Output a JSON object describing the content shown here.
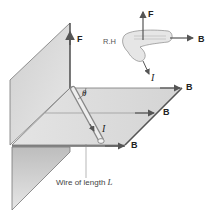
{
  "diagram": {
    "labels": {
      "force_plane": "F",
      "force_hand": "F",
      "field_hand": "B",
      "current_hand": "I",
      "right_hand": "R.H",
      "field_top": "B",
      "field_middle": "B",
      "field_bottom": "B",
      "angle": "θ",
      "current_wire": "I",
      "wire_caption_prefix": "Wire of length ",
      "wire_caption_var": "L"
    },
    "colors": {
      "plane_fill": "#d9d9d9",
      "plane_edge": "#777777",
      "arrow": "#555555",
      "text": "#222222"
    }
  }
}
